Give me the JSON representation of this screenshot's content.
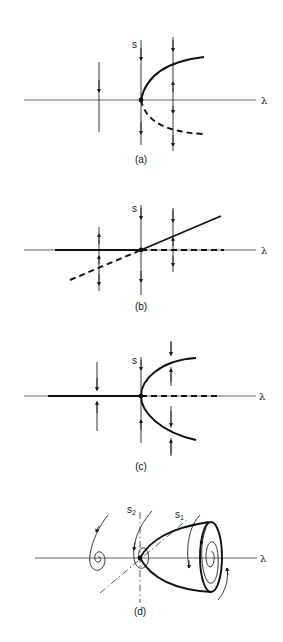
{
  "figure": {
    "panels": [
      {
        "id": "a",
        "caption": "(a)",
        "vertical_axis_label": "s",
        "horizontal_axis_label": "λ",
        "description": "Saddle-node (fold) bifurcation: stable upper branch (solid), unstable lower branch (dashed)"
      },
      {
        "id": "b",
        "caption": "(b)",
        "vertical_axis_label": "s",
        "horizontal_axis_label": "λ",
        "description": "Transcritical bifurcation: exchange of stability between trivial and sloped branches"
      },
      {
        "id": "c",
        "caption": "(c)",
        "vertical_axis_label": "s",
        "horizontal_axis_label": "λ",
        "description": "Supercritical pitchfork bifurcation: trivial branch loses stability, two stable branches emerge"
      },
      {
        "id": "d",
        "caption": "(d)",
        "vertical_axis_label_1": "s",
        "vertical_axis_label_1_sub": "1",
        "vertical_axis_label_2": "s",
        "vertical_axis_label_2_sub": "2",
        "horizontal_axis_label": "λ",
        "description": "Hopf bifurcation: stable focus becomes unstable, stable limit cycle emerges"
      }
    ],
    "legend": {
      "solid": "stable",
      "dashed": "unstable"
    }
  }
}
